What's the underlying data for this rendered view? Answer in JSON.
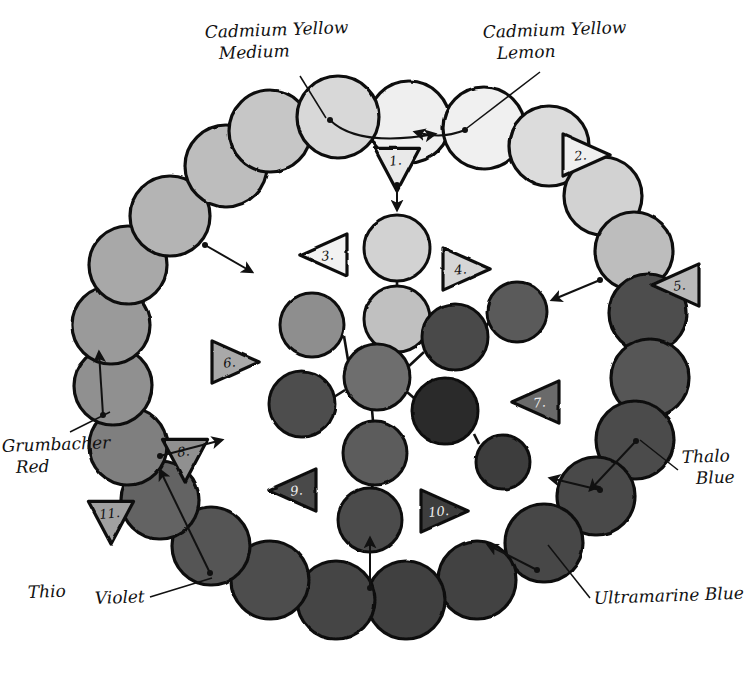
{
  "diagram": {
    "background_color": "#ffffff",
    "ink_color": "#111111"
  },
  "labels": [
    {
      "name": "cadmium-yellow-medium",
      "line1": "Cadmium Yellow",
      "line2": "Medium",
      "x": 205,
      "y": 38,
      "anchor": "start"
    },
    {
      "name": "cadmium-yellow-lemon",
      "line1": "Cadmium Yellow",
      "line2": "Lemon",
      "x": 483,
      "y": 38,
      "anchor": "start"
    },
    {
      "name": "grumbacher-red",
      "line1": "Grumbacher",
      "line2": "Red",
      "x": 2,
      "y": 452,
      "anchor": "start"
    },
    {
      "name": "thalo-blue",
      "line1": "Thalo",
      "line2": "Blue",
      "x": 682,
      "y": 463,
      "anchor": "start"
    },
    {
      "name": "thio",
      "line1": "Thio",
      "line2": "",
      "x": 28,
      "y": 598,
      "anchor": "start"
    },
    {
      "name": "violet",
      "line1": "Violet",
      "line2": "",
      "x": 95,
      "y": 604,
      "anchor": "start"
    },
    {
      "name": "ultramarine-blue",
      "line1": "Ultramarine Blue",
      "line2": "",
      "x": 594,
      "y": 604,
      "anchor": "start"
    }
  ],
  "triangles": [
    {
      "name": "triangle-1",
      "number": "1.",
      "x": 397,
      "y": 168,
      "dir": "down",
      "fill": "#e9e9e9"
    },
    {
      "name": "triangle-2",
      "number": "2.",
      "x": 586,
      "y": 155,
      "dir": "right",
      "fill": "#efefef"
    },
    {
      "name": "triangle-3",
      "number": "3.",
      "x": 324,
      "y": 255,
      "dir": "left",
      "fill": "#f2f2f2"
    },
    {
      "name": "triangle-4",
      "number": "4.",
      "x": 466,
      "y": 269,
      "dir": "right",
      "fill": "#d6d6d6"
    },
    {
      "name": "triangle-5",
      "number": "5.",
      "x": 676,
      "y": 285,
      "dir": "left",
      "fill": "#b9b9b9"
    },
    {
      "name": "triangle-6",
      "number": "6.",
      "x": 235,
      "y": 362,
      "dir": "right",
      "fill": "#a9a9a9"
    },
    {
      "name": "triangle-7",
      "number": "7.",
      "x": 536,
      "y": 402,
      "dir": "left",
      "fill": "#6a6a6a"
    },
    {
      "name": "triangle-8",
      "number": "8.",
      "x": 185,
      "y": 459,
      "dir": "down",
      "fill": "#909090"
    },
    {
      "name": "triangle-9",
      "number": "9.",
      "x": 293,
      "y": 490,
      "dir": "left",
      "fill": "#4a4a4a"
    },
    {
      "name": "triangle-10",
      "number": "10.",
      "x": 444,
      "y": 511,
      "dir": "right",
      "fill": "#3d3d3d"
    },
    {
      "name": "triangle-11",
      "number": "11.",
      "x": 111,
      "y": 521,
      "dir": "down",
      "fill": "#a0a0a0"
    }
  ],
  "outer_ring": {
    "description": "Outer ring of hand-drawn color swatch circles",
    "circles": [
      {
        "name": "outer-swatch-1",
        "cx": 409,
        "cy": 122,
        "r": 41,
        "fill": "#efefef"
      },
      {
        "name": "outer-swatch-2",
        "cx": 484,
        "cy": 128,
        "r": 41,
        "fill": "#f0f0f0"
      },
      {
        "name": "outer-swatch-3",
        "cx": 549,
        "cy": 146,
        "r": 40,
        "fill": "#dcdcdc"
      },
      {
        "name": "outer-swatch-4",
        "cx": 603,
        "cy": 196,
        "r": 39,
        "fill": "#d2d2d2"
      },
      {
        "name": "outer-swatch-5",
        "cx": 634,
        "cy": 251,
        "r": 39,
        "fill": "#bdbdbd"
      },
      {
        "name": "outer-swatch-6",
        "cx": 648,
        "cy": 313,
        "r": 39,
        "fill": "#4e4e4e"
      },
      {
        "name": "outer-swatch-7",
        "cx": 650,
        "cy": 378,
        "r": 39,
        "fill": "#565656"
      },
      {
        "name": "outer-swatch-8",
        "cx": 635,
        "cy": 440,
        "r": 39,
        "fill": "#4c4c4c"
      },
      {
        "name": "outer-swatch-9",
        "cx": 596,
        "cy": 496,
        "r": 39,
        "fill": "#4a4a4a"
      },
      {
        "name": "outer-swatch-10",
        "cx": 544,
        "cy": 543,
        "r": 39,
        "fill": "#474747"
      },
      {
        "name": "outer-swatch-11",
        "cx": 477,
        "cy": 580,
        "r": 39,
        "fill": "#424242"
      },
      {
        "name": "outer-swatch-12",
        "cx": 406,
        "cy": 600,
        "r": 39,
        "fill": "#3f3f3f"
      },
      {
        "name": "outer-swatch-13",
        "cx": 336,
        "cy": 600,
        "r": 39,
        "fill": "#454545"
      },
      {
        "name": "outer-swatch-14",
        "cx": 270,
        "cy": 580,
        "r": 39,
        "fill": "#4d4d4d"
      },
      {
        "name": "outer-swatch-15",
        "cx": 211,
        "cy": 546,
        "r": 39,
        "fill": "#555555"
      },
      {
        "name": "outer-swatch-16",
        "cx": 160,
        "cy": 500,
        "r": 39,
        "fill": "#636363"
      },
      {
        "name": "outer-swatch-17",
        "cx": 128,
        "cy": 446,
        "r": 39,
        "fill": "#7f7f7f"
      },
      {
        "name": "outer-swatch-18",
        "cx": 113,
        "cy": 386,
        "r": 39,
        "fill": "#909090"
      },
      {
        "name": "outer-swatch-19",
        "cx": 111,
        "cy": 325,
        "r": 39,
        "fill": "#9a9a9a"
      },
      {
        "name": "outer-swatch-20",
        "cx": 128,
        "cy": 265,
        "r": 39,
        "fill": "#a8a8a8"
      },
      {
        "name": "outer-swatch-21",
        "cx": 170,
        "cy": 216,
        "r": 40,
        "fill": "#b4b4b4"
      },
      {
        "name": "outer-swatch-22",
        "cx": 226,
        "cy": 166,
        "r": 41,
        "fill": "#bdbdbd"
      },
      {
        "name": "outer-swatch-23",
        "cx": 270,
        "cy": 131,
        "r": 41,
        "fill": "#c6c6c6"
      },
      {
        "name": "outer-swatch-24",
        "cx": 338,
        "cy": 117,
        "r": 41,
        "fill": "#d8d8d8"
      }
    ]
  },
  "inner_cluster": {
    "description": "Inner mixing cluster of circles joined by straight connector lines",
    "circles": [
      {
        "name": "inner-swatch-top",
        "cx": 397,
        "cy": 248,
        "r": 33,
        "fill": "#d2d2d2"
      },
      {
        "name": "inner-swatch-upper",
        "cx": 397,
        "cy": 319,
        "r": 33,
        "fill": "#c0c0c0"
      },
      {
        "name": "inner-swatch-left-upper",
        "cx": 312,
        "cy": 325,
        "r": 32,
        "fill": "#8e8e8e"
      },
      {
        "name": "inner-swatch-center",
        "cx": 377,
        "cy": 377,
        "r": 33,
        "fill": "#6e6e6e"
      },
      {
        "name": "inner-swatch-right-upper",
        "cx": 455,
        "cy": 337,
        "r": 33,
        "fill": "#4a4a4a"
      },
      {
        "name": "inner-swatch-far-right",
        "cx": 517,
        "cy": 312,
        "r": 30,
        "fill": "#5a5a5a"
      },
      {
        "name": "inner-swatch-left",
        "cx": 302,
        "cy": 404,
        "r": 33,
        "fill": "#4e4e4e"
      },
      {
        "name": "inner-swatch-below",
        "cx": 375,
        "cy": 453,
        "r": 32,
        "fill": "#5b5b5b"
      },
      {
        "name": "inner-swatch-bottom",
        "cx": 370,
        "cy": 520,
        "r": 32,
        "fill": "#4b4b4b"
      },
      {
        "name": "inner-swatch-dark",
        "cx": 445,
        "cy": 411,
        "r": 33,
        "fill": "#2b2b2b"
      },
      {
        "name": "inner-swatch-right-low",
        "cx": 503,
        "cy": 462,
        "r": 27,
        "fill": "#3c3c3c"
      }
    ],
    "connectors": [
      {
        "name": "connector-top-upper",
        "x1": 397,
        "y1": 281,
        "x2": 397,
        "y2": 286
      },
      {
        "name": "connector-upper-center",
        "x1": 390,
        "y1": 350,
        "x2": 381,
        "y2": 346
      },
      {
        "name": "connector-left-center",
        "x1": 344,
        "y1": 336,
        "x2": 348,
        "y2": 360
      },
      {
        "name": "connector-center-right",
        "x1": 409,
        "y1": 366,
        "x2": 424,
        "y2": 352
      },
      {
        "name": "connector-right-far",
        "x1": 486,
        "y1": 327,
        "x2": 489,
        "y2": 322
      },
      {
        "name": "connector-left-low",
        "x1": 334,
        "y1": 397,
        "x2": 345,
        "y2": 390
      },
      {
        "name": "connector-center-below",
        "x1": 372,
        "y1": 410,
        "x2": 373,
        "y2": 421
      },
      {
        "name": "connector-below-bottom",
        "x1": 373,
        "y1": 485,
        "x2": 371,
        "y2": 489
      },
      {
        "name": "connector-center-dark",
        "x1": 407,
        "y1": 392,
        "x2": 414,
        "y2": 398
      },
      {
        "name": "connector-dark-rlow",
        "x1": 474,
        "y1": 434,
        "x2": 479,
        "y2": 444
      }
    ]
  },
  "arrows": [
    {
      "name": "arrow-cym-to-center",
      "d": "M 330,120 C 350,140 390,142 435,134",
      "head": 435,
      "headY": 134
    },
    {
      "name": "arrow-cyl-to-center",
      "d": "M 465,130 C 445,138 430,136 415,132",
      "head": 415,
      "headY": 132
    },
    {
      "name": "arrow-t1-down",
      "d": "M 397,185 L 397,210",
      "head": 397,
      "headY": 210
    },
    {
      "name": "arrow-upper-left-out",
      "d": "M 205,245 L 252,272",
      "head": 252,
      "headY": 272
    },
    {
      "name": "arrow-right-in",
      "d": "M 600,280 L 552,300",
      "head": 552,
      "headY": 300
    },
    {
      "name": "arrow-red-up",
      "d": "M 103,415 L 99,352",
      "head": 99,
      "headY": 352
    },
    {
      "name": "arrow-t8-right",
      "d": "M 160,456 L 222,440",
      "head": 222,
      "headY": 440
    },
    {
      "name": "arrow-thio-up",
      "d": "M 210,573 L 160,470",
      "head": 160,
      "headY": 470
    },
    {
      "name": "arrow-bottom-up",
      "d": "M 370,588 L 370,538",
      "head": 370,
      "headY": 538
    },
    {
      "name": "arrow-ultra-in",
      "d": "M 537,570 L 488,545",
      "head": 488,
      "headY": 545
    },
    {
      "name": "arrow-thalo-in",
      "d": "M 636,441 L 590,490",
      "head": 590,
      "headY": 490
    },
    {
      "name": "arrow-blue-left",
      "d": "M 600,490 L 550,478",
      "head": 550,
      "headY": 478
    }
  ],
  "leaders": [
    {
      "name": "leader-cym",
      "d": "M 300,76 L 326,118"
    },
    {
      "name": "leader-cyl",
      "d": "M 540,72 L 467,128"
    },
    {
      "name": "leader-red",
      "d": "M 70,432 L 110,412"
    },
    {
      "name": "leader-thalo",
      "d": "M 678,470 L 640,440"
    },
    {
      "name": "leader-violet",
      "d": "M 150,597 L 212,578"
    },
    {
      "name": "leader-ultra",
      "d": "M 590,598 L 548,545"
    }
  ]
}
